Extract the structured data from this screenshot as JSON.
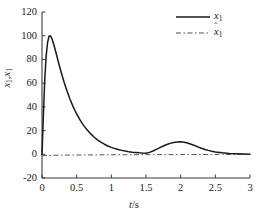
{
  "chart_data": {
    "type": "line",
    "title": "",
    "xlabel": "t/s",
    "ylabel": "x1,x1hat",
    "xlim": [
      0,
      3
    ],
    "ylim": [
      -20,
      120
    ],
    "grid": false,
    "legend_position": "top-right",
    "xticks": [
      "0",
      "0.5",
      "1",
      "1.5",
      "2",
      "2.5",
      "3"
    ],
    "xtick_values": [
      0,
      0.5,
      1,
      1.5,
      2,
      2.5,
      3
    ],
    "yticks": [
      "120",
      "100",
      "80",
      "60",
      "40",
      "20",
      "0",
      "-20"
    ],
    "ytick_values": [
      120,
      100,
      80,
      60,
      40,
      20,
      0,
      -20
    ],
    "series": [
      {
        "name": "x1",
        "legend_label": "x₁",
        "style": "solid",
        "color": "#1a1a1a",
        "x": [
          0.0,
          0.02,
          0.04,
          0.06,
          0.08,
          0.1,
          0.12,
          0.14,
          0.16,
          0.18,
          0.2,
          0.24,
          0.28,
          0.32,
          0.36,
          0.4,
          0.45,
          0.5,
          0.55,
          0.6,
          0.65,
          0.7,
          0.75,
          0.8,
          0.85,
          0.9,
          0.95,
          1.0,
          1.05,
          1.1,
          1.15,
          1.2,
          1.25,
          1.3,
          1.35,
          1.4,
          1.45,
          1.5,
          1.55,
          1.6,
          1.65,
          1.7,
          1.75,
          1.8,
          1.85,
          1.9,
          1.95,
          2.0,
          2.05,
          2.1,
          2.15,
          2.2,
          2.25,
          2.3,
          2.35,
          2.4,
          2.45,
          2.5,
          2.6,
          2.7,
          2.8,
          2.9,
          3.0
        ],
        "y": [
          0.0,
          33.0,
          63.0,
          83.0,
          94.0,
          99.5,
          100.0,
          98.0,
          94.5,
          90.5,
          86.0,
          77.0,
          68.5,
          60.5,
          53.5,
          47.0,
          40.0,
          34.0,
          28.8,
          24.4,
          20.6,
          17.4,
          14.6,
          12.2,
          10.2,
          8.5,
          7.0,
          5.8,
          4.8,
          4.0,
          3.3,
          2.7,
          2.2,
          1.8,
          1.5,
          1.2,
          1.0,
          0.9,
          1.6,
          2.8,
          4.2,
          5.6,
          7.0,
          8.2,
          9.2,
          9.9,
          10.3,
          10.5,
          10.2,
          9.5,
          8.5,
          7.4,
          6.2,
          5.1,
          4.1,
          3.3,
          2.6,
          2.0,
          1.2,
          0.7,
          0.4,
          0.2,
          0.1
        ]
      },
      {
        "name": "x1hat",
        "legend_label": "x̂₁",
        "style": "dash-dot",
        "color": "#555555",
        "x": [
          0.0,
          0.05,
          0.1,
          0.2,
          0.3,
          0.5,
          0.8,
          1.0,
          1.3,
          1.5,
          1.8,
          2.0,
          2.3,
          2.6,
          3.0
        ],
        "y": [
          -1.2,
          -1.0,
          -0.9,
          -0.8,
          -0.7,
          -0.6,
          -0.5,
          -0.4,
          -0.4,
          -0.3,
          -0.3,
          -0.2,
          -0.2,
          -0.1,
          -0.1
        ]
      }
    ]
  },
  "axis": {
    "xlabel_var": "t",
    "xlabel_unit": "/s",
    "ylabel_first_var": "x",
    "ylabel_first_sub": "1",
    "ylabel_separator": ",",
    "ylabel_second_var": "x",
    "ylabel_second_sub": "1",
    "ylabel_hat": "ˆ"
  },
  "legend": {
    "entries": [
      {
        "var": "x",
        "sub": "1",
        "hat": "",
        "style": "solid"
      },
      {
        "var": "x",
        "sub": "1",
        "hat": "ˆ",
        "style": "dash-dot"
      }
    ]
  },
  "colors": {
    "axis": "#3c3c3c",
    "series_solid": "#1a1a1a",
    "series_dashed": "#555555",
    "background": "#ffffff"
  }
}
